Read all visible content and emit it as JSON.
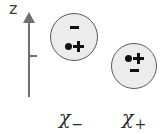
{
  "figure": {
    "background_color": "#ffffff",
    "axis": {
      "label": "z",
      "name": "z-axis",
      "direction": "up",
      "tick_count": 1,
      "color": "#6e6e6e"
    },
    "spheres": [
      {
        "id": "chi-minus",
        "label": "χ",
        "subscript": "−",
        "fill_color": "#ececec",
        "stroke_color": "#5a5a5a",
        "top_symbol": "minus",
        "bottom_symbol": "dot-plus",
        "position": "upper-left"
      },
      {
        "id": "chi-plus",
        "label": "χ",
        "subscript": "+",
        "fill_color": "#ececec",
        "stroke_color": "#5a5a5a",
        "top_symbol": "dot-plus",
        "bottom_symbol": "minus",
        "position": "lower-right"
      }
    ],
    "symbols": {
      "minus": "−",
      "plus": "+",
      "dot": "●"
    }
  }
}
